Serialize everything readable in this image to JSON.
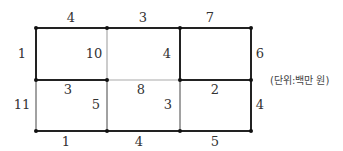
{
  "diagram": {
    "unit_note": "(단위:백만 원)",
    "top_edges": [
      "4",
      "3",
      "7"
    ],
    "bottom_edges": [
      "1",
      "4",
      "5"
    ],
    "left_edges": [
      "1",
      "11"
    ],
    "right_edges": [
      "6",
      "4"
    ],
    "top_row_cells": [
      "10",
      "4",
      ""
    ],
    "middle_edges": [
      "3",
      "8",
      "2"
    ],
    "bottom_row_cells": [
      "5",
      "3",
      ""
    ]
  }
}
